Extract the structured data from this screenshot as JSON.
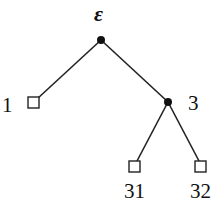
{
  "diagram": {
    "type": "tree",
    "root": {
      "label": "ε",
      "kind": "internal"
    },
    "nodes": [
      {
        "id": "eps",
        "label": "ε",
        "kind": "internal"
      },
      {
        "id": "1",
        "label": "1",
        "kind": "leaf"
      },
      {
        "id": "3",
        "label": "3",
        "kind": "internal"
      },
      {
        "id": "31",
        "label": "31",
        "kind": "leaf"
      },
      {
        "id": "32",
        "label": "32",
        "kind": "leaf"
      }
    ],
    "edges": [
      [
        "eps",
        "1"
      ],
      [
        "eps",
        "3"
      ],
      [
        "3",
        "31"
      ],
      [
        "3",
        "32"
      ]
    ],
    "legend": {
      "internal_node": "filled circle",
      "leaf_node": "open square"
    }
  },
  "labels": {
    "root": "ε",
    "n1": "1",
    "n3": "3",
    "n31": "31",
    "n32": "32"
  }
}
